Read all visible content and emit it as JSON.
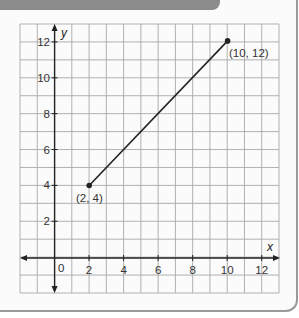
{
  "chart_data": {
    "type": "line",
    "title": "",
    "xlabel": "x",
    "ylabel": "y",
    "xlim": [
      -2,
      13
    ],
    "ylim": [
      -2,
      13
    ],
    "grid": true,
    "x_ticks": [
      2,
      4,
      6,
      8,
      10,
      12
    ],
    "y_ticks": [
      2,
      4,
      6,
      8,
      10,
      12
    ],
    "origin_label": "0",
    "series": [
      {
        "name": "segment",
        "points": [
          [
            2,
            4
          ],
          [
            10,
            12
          ]
        ],
        "point_labels": [
          "(2, 4)",
          "(10, 12)"
        ]
      }
    ]
  },
  "labels": {
    "x_axis": "x",
    "y_axis": "y",
    "origin": "0",
    "x_ticks": [
      "2",
      "4",
      "6",
      "8",
      "10",
      "12"
    ],
    "y_ticks": [
      "2",
      "4",
      "6",
      "8",
      "10",
      "12"
    ],
    "point_start": "(2, 4)",
    "point_end": "(10, 12)"
  },
  "colors": {
    "grid": "#a8a8a8",
    "axis": "#222222",
    "line": "#222222",
    "band": "#8c8c8c"
  }
}
